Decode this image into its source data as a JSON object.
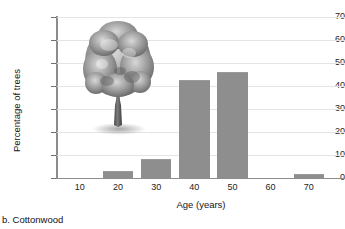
{
  "caption": "b. Cottonwood",
  "decoration": {
    "tree_icon": "deciduous-tree-illustration"
  },
  "chart_data": {
    "type": "bar",
    "title": "",
    "xlabel": "Age (years)",
    "ylabel": "Percentage of trees",
    "categories": [
      "10",
      "20",
      "30",
      "40",
      "50",
      "60",
      "70"
    ],
    "values": [
      0,
      2.5,
      8,
      42,
      45.5,
      0,
      1.5
    ],
    "ylim": [
      0,
      70
    ],
    "yticks": [
      0,
      10,
      20,
      30,
      40,
      50,
      60,
      70
    ],
    "ytick_labels": [
      "0",
      "10",
      "20",
      "30",
      "40",
      "50",
      "60",
      "70"
    ],
    "xticks": [
      10,
      20,
      30,
      40,
      50,
      60,
      70
    ],
    "xtick_labels": [
      "10",
      "20",
      "30",
      "40",
      "50",
      "60",
      "70"
    ],
    "grid": true,
    "legend": "none",
    "bar_color": "#8e8e8e",
    "axis_color": "#8c8c8c",
    "grid_color": "#e4e4e4"
  }
}
